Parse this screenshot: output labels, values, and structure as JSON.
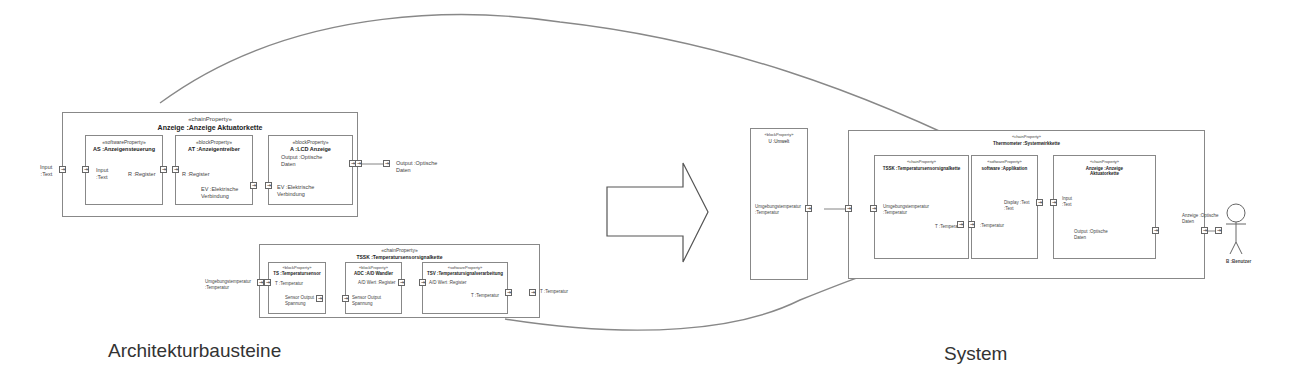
{
  "captions": {
    "left": "Architekturbausteine",
    "right": "System"
  },
  "anzeige_chain": {
    "stereotype": "«chainProperty»",
    "name": "Anzeige :Anzeige Aktuatorkette",
    "external_in": "Input\n:Text",
    "external_out": "Output :Optische\nDaten",
    "blocks": [
      {
        "stereotype": "«softwareProperty»",
        "name": "AS :Anzeigensteuerung",
        "in_label": "Input\n:Text",
        "out_label": "R :Register"
      },
      {
        "stereotype": "«blockProperty»",
        "name": "AT :Anzeigentreiber",
        "in_label": "R :Register",
        "out_label": "EV :Elektrische\nVerbindung"
      },
      {
        "stereotype": "«blockProperty»",
        "name": "A :LCD Anzeige",
        "in_label": "EV :Elektrische\nVerbindung",
        "out_label": "Output :Optische\nDaten"
      }
    ]
  },
  "sensor_chain": {
    "stereotype": "«chainProperty»",
    "name": "TSSK :Temperatursensorsignalkette",
    "external_in": "Umgebungstemperatur\n:Temperatur",
    "external_out": "T :Temperatur",
    "blocks": [
      {
        "stereotype": "«blockProperty»",
        "name": "TS :Temperatursensor",
        "in_label": "T :Temperatur",
        "out_label": "Sensor Output\nSpannung"
      },
      {
        "stereotype": "«blockProperty»",
        "name": "ADC :A/D Wandler",
        "in_label": "Sensor Output\nSpannung",
        "out_label": "A/D Wert :Register"
      },
      {
        "stereotype": "«softwareProperty»",
        "name": "TSV :Temperatursignalverarbeitung",
        "in_label": "A/D Wert :Register",
        "out_label": "T :Temperatur"
      }
    ]
  },
  "system": {
    "environment": {
      "stereotype": "«blockProperty»",
      "name": "U :Umwelt",
      "port_label": "Umgebungstemperatur\n:Temperatur"
    },
    "chain": {
      "stereotype": "«chainProperty»",
      "name": "Thermometer :Systemwirkkette"
    },
    "blocks": [
      {
        "stereotype": "«chainProperty»",
        "name": "TSSK :Temperatursensorsignalkette",
        "in_label": "Umgebungstemperatur\n:Temperatur",
        "out_label": "T :Temperatur"
      },
      {
        "stereotype": "«softwareProperty»",
        "name": "software :Applikation",
        "in_label": ":Temperatur",
        "out_label": "Display :Text\n:Text"
      },
      {
        "stereotype": "«chainProperty»",
        "name": "Anzeige :Anzeige\nAktuatorkette",
        "in_label": "Input\n:Text",
        "out_label": "Output :Optische\nDaten"
      }
    ],
    "system_out_label": "Anzeige :Optische\nDaten",
    "user": {
      "name": "B :Benutzer"
    }
  },
  "port_glyph": "⇥"
}
